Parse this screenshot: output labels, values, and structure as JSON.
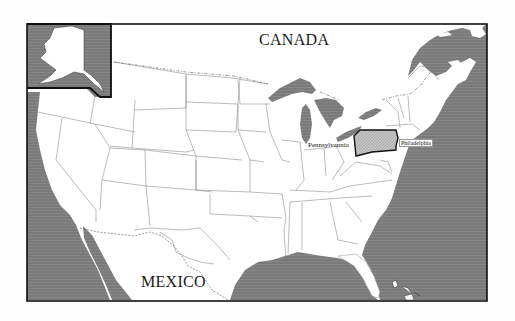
{
  "map": {
    "title": "United States map highlighting Pennsylvania",
    "colors": {
      "water": "#7a7a7a",
      "land": "#ffffff",
      "border": "#1a1a1a",
      "highlight": "#bdbdbd",
      "state_lines": "#777777",
      "page": "#fdfdfd"
    },
    "labels": {
      "canada": "CANADA",
      "mexico": "MEXICO",
      "state": "Pennsylvannia",
      "city": "Philadelphia"
    },
    "inset": {
      "name": "Alaska inset"
    },
    "highlighted_state": "Pennsylvania"
  }
}
